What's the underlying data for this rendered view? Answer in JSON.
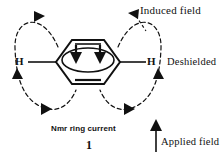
{
  "figure": {
    "title_caption": "Nmr ring current",
    "figure_number": "1",
    "labels": {
      "induced_field": "Induced field",
      "deshielded": "Deshielded",
      "applied_field": "Applied field",
      "hydrogen_left": "H",
      "hydrogen_right": "H"
    },
    "colors": {
      "ink": "#111111",
      "background": "#ffffff"
    },
    "elements": {
      "ring": "benzene-hexagon",
      "ring_current_arrows": 2,
      "induced_field_loops": 2,
      "loop_arrowheads": 6,
      "applied_field_direction": "up"
    }
  }
}
